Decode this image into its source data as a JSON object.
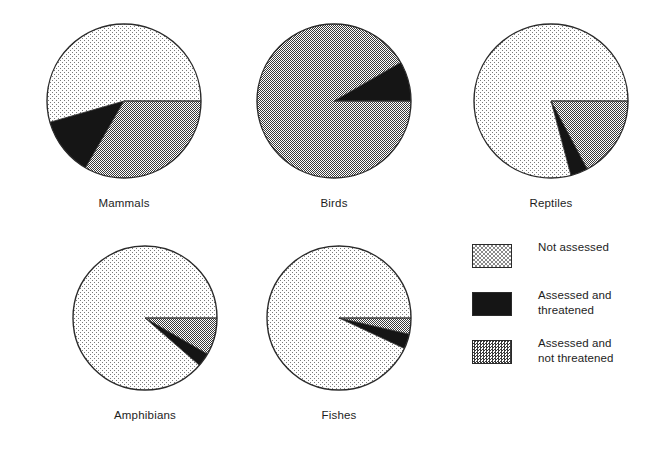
{
  "chart_data": {
    "type": "pie",
    "title": "",
    "subtitle": "",
    "xlabel": "",
    "ylabel": "",
    "grid": false,
    "legend_position": "bottom-right",
    "categories": [
      "Not assessed",
      "Assessed and threatened",
      "Assessed and not threatened"
    ],
    "colors": {
      "not_assessed": "#d9d9d9",
      "assessed_threatened": "#141414",
      "assessed_not_threatened": "#8f8f8f",
      "outline": "#2a2a2a",
      "background": "#ffffff"
    },
    "charts": [
      {
        "label": "Mammals",
        "values": [
          54.5,
          12.0,
          33.5
        ],
        "slices": [
          {
            "name": "Not assessed",
            "percent": 54.5
          },
          {
            "name": "Assessed and threatened",
            "percent": 12.0
          },
          {
            "name": "Assessed and not threatened",
            "percent": 33.5
          }
        ]
      },
      {
        "label": "Birds",
        "values": [
          0.0,
          8.0,
          92.0
        ],
        "slices": [
          {
            "name": "Not assessed",
            "percent": 0.0
          },
          {
            "name": "Assessed and threatened",
            "percent": 8.0
          },
          {
            "name": "Assessed and not threatened",
            "percent": 92.0
          }
        ]
      },
      {
        "label": "Reptiles",
        "values": [
          79.0,
          3.5,
          17.5
        ],
        "slices": [
          {
            "name": "Not assessed",
            "percent": 79.0
          },
          {
            "name": "Assessed and threatened",
            "percent": 3.5
          },
          {
            "name": "Assessed and not threatened",
            "percent": 17.5
          }
        ]
      },
      {
        "label": "Amphibians",
        "values": [
          88.5,
          3.0,
          8.5
        ],
        "slices": [
          {
            "name": "Not assessed",
            "percent": 88.5
          },
          {
            "name": "Assessed and threatened",
            "percent": 3.0
          },
          {
            "name": "Assessed and not threatened",
            "percent": 8.5
          }
        ]
      },
      {
        "label": "Fishes",
        "values": [
          93.0,
          3.5,
          3.5
        ],
        "slices": [
          {
            "name": "Not assessed",
            "percent": 93.0
          },
          {
            "name": "Assessed and threatened",
            "percent": 3.5
          },
          {
            "name": "Assessed and not threatened",
            "percent": 3.5
          }
        ]
      }
    ]
  },
  "pies": [
    {
      "label": "Mammals",
      "cx": 124,
      "cy": 101,
      "r": 77,
      "wedges": [
        {
          "key": "not_assessed",
          "start": 0,
          "end": 196
        },
        {
          "key": "assessed_threatened",
          "start": 196,
          "end": 240
        },
        {
          "key": "assessed_not_threatened",
          "start": 240,
          "end": 360
        }
      ]
    },
    {
      "label": "Birds",
      "cx": 334,
      "cy": 101,
      "r": 77,
      "wedges": [
        {
          "key": "assessed_threatened",
          "start": 0,
          "end": 30
        },
        {
          "key": "assessed_not_threatened",
          "start": 30,
          "end": 360
        }
      ]
    },
    {
      "label": "Reptiles",
      "cx": 551,
      "cy": 101,
      "r": 77,
      "wedges": [
        {
          "key": "assessed_not_threatened",
          "start": 298,
          "end": 360
        },
        {
          "key": "assessed_threatened",
          "start": 285,
          "end": 298
        },
        {
          "key": "not_assessed",
          "start": 0,
          "end": 285
        }
      ]
    },
    {
      "label": "Amphibians",
      "cx": 145,
      "cy": 318,
      "r": 72,
      "wedges": [
        {
          "key": "assessed_not_threatened",
          "start": 330,
          "end": 360
        },
        {
          "key": "assessed_threatened",
          "start": 319,
          "end": 330
        },
        {
          "key": "not_assessed",
          "start": 0,
          "end": 319
        }
      ]
    },
    {
      "label": "Fishes",
      "cx": 339,
      "cy": 318,
      "r": 72,
      "wedges": [
        {
          "key": "assessed_not_threatened",
          "start": 347,
          "end": 360
        },
        {
          "key": "assessed_threatened",
          "start": 335,
          "end": 347
        },
        {
          "key": "not_assessed",
          "start": 0,
          "end": 335
        }
      ]
    }
  ],
  "legend": {
    "items": [
      {
        "swatch": "not_assessed",
        "line1": "Not assessed",
        "line2": ""
      },
      {
        "swatch": "assessed_threatened",
        "line1": "Assessed and",
        "line2": "threatened"
      },
      {
        "swatch": "assessed_not_threatened",
        "line1": "Assessed and",
        "line2": "not threatened"
      }
    ]
  }
}
